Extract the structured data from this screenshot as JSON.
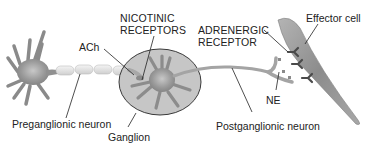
{
  "diagram": {
    "labels": {
      "nicotinic_receptors_line1": "NICOTINIC",
      "nicotinic_receptors_line2": "RECEPTORS",
      "ach": "ACh",
      "adrenergic_receptor_line1": "ADRENERGIC",
      "adrenergic_receptor_line2": "RECEPTOR",
      "effector_cell": "Effector cell",
      "ne": "NE",
      "preganglionic_neuron": "Preganglionic neuron",
      "ganglion": "Ganglion",
      "postganglionic_neuron": "Postganglionic neuron"
    },
    "colors": {
      "cell_fill": "#9a9a9a",
      "cell_dark": "#6e6e6e",
      "ganglion_fill": "#c4c4c4",
      "ganglion_stroke": "#3a3a3a",
      "myelin": "#e6e6e6",
      "receptor": "#4a4a4a",
      "leader": "#222222"
    }
  }
}
